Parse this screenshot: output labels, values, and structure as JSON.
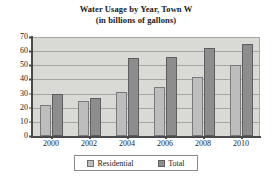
{
  "chart_data": {
    "type": "bar",
    "title": "Water Usage by Year, Town W",
    "subtitle": "(in billions of gallons)",
    "xlabel": "",
    "ylabel": "",
    "categories": [
      "2000",
      "2002",
      "2004",
      "2006",
      "2008",
      "2010"
    ],
    "series": [
      {
        "name": "Residential",
        "values": [
          22,
          25,
          31,
          35,
          42,
          50
        ],
        "color": "#bdbdbd"
      },
      {
        "name": "Total",
        "values": [
          30,
          27,
          55,
          56,
          62,
          65
        ],
        "color": "#8d8d8d"
      }
    ],
    "ylim": [
      0,
      70
    ],
    "yticks": [
      0,
      10,
      20,
      30,
      40,
      50,
      60,
      70
    ],
    "grid": true,
    "legend_position": "bottom",
    "plot_background": "#d9d9d5"
  },
  "legend": {
    "entries": [
      {
        "label": "Residential"
      },
      {
        "label": "Total"
      }
    ]
  }
}
